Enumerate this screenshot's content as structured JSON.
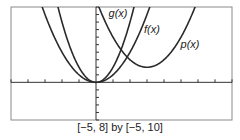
{
  "chart_data": {
    "type": "line",
    "title": "",
    "xlabel": "",
    "ylabel": "",
    "xlim": [
      -5,
      8
    ],
    "ylim": [
      -5,
      10
    ],
    "x_tick_step": 1,
    "y_tick_step": 1,
    "grid": false,
    "legend": "inline labels on curves",
    "caption": "[−5, 8] by [−5, 10]",
    "series": [
      {
        "name": "f(x)",
        "label": "f(x)",
        "equation": "x^2",
        "a": 1,
        "h": 0,
        "k": 0,
        "color": "#2a2a2a",
        "label_pos": [
          152,
          33
        ]
      },
      {
        "name": "g(x)",
        "label": "g(x)",
        "equation": "2x^2",
        "a": 2,
        "h": 0,
        "k": 0,
        "color": "#2a2a2a",
        "label_pos": [
          118,
          17
        ]
      },
      {
        "name": "p(x)",
        "label": "p(x)",
        "equation": "(x-3)^2+2",
        "a": 1,
        "h": 3,
        "k": 2,
        "color": "#2a2a2a",
        "label_pos": [
          190,
          48
        ]
      }
    ]
  },
  "frame": {
    "left": 11,
    "right": 232,
    "top": 7,
    "bottom": 120,
    "border_color": "#8a8a8a",
    "axis_color": "#333333"
  }
}
